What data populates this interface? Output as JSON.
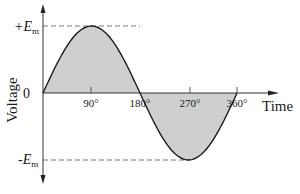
{
  "chart_data": {
    "type": "line",
    "title": "",
    "xlabel": "Time",
    "ylabel": "Voltage",
    "x_ticks": [
      "90°",
      "180°",
      "270°",
      "360°"
    ],
    "y_ticks": [
      "+E_m",
      "0",
      "-E_m"
    ],
    "y_tick_labels": {
      "pos": "+E",
      "neg": "-E",
      "sub": "m",
      "zero": "0"
    },
    "x": [
      0,
      30,
      60,
      90,
      120,
      150,
      180,
      210,
      240,
      270,
      300,
      330,
      360
    ],
    "series": [
      {
        "name": "sine wave",
        "values": [
          0,
          0.5,
          0.866,
          1,
          0.866,
          0.5,
          0,
          -0.5,
          -0.866,
          -1,
          -0.866,
          -0.5,
          0
        ]
      }
    ],
    "xlim": [
      0,
      360
    ],
    "ylim": [
      -1,
      1
    ],
    "fill_under_curve": true,
    "reference_lines": [
      "dashed at +E_m",
      "dashed at -E_m"
    ],
    "grid": false,
    "legend": null,
    "colors": {
      "curve": "#1a1a1a",
      "fill": "#cfcfcf",
      "axis": "#333333",
      "dash": "#555555"
    }
  }
}
